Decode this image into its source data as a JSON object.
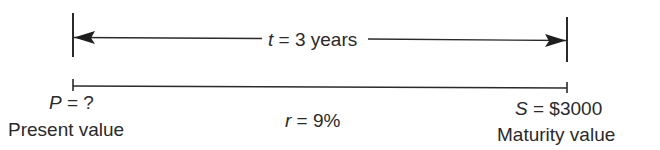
{
  "diagram": {
    "type": "timeline",
    "time_span": {
      "variable": "t",
      "equals": "=",
      "value": "3 years"
    },
    "start": {
      "variable": "P",
      "equals": "=",
      "value": "?",
      "caption": "Present value"
    },
    "rate": {
      "variable": "r",
      "equals": "=",
      "value": "9%"
    },
    "end": {
      "variable": "S",
      "equals": "=",
      "value": "$3000",
      "caption": "Maturity value"
    },
    "colors": {
      "ink": "#2a2a2a",
      "background": "#ffffff"
    }
  }
}
